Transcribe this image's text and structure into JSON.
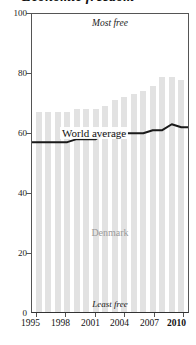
{
  "title": "Economic freedom",
  "chart_data": {
    "type": "bar",
    "title": "Economic freedom",
    "xlabel": "",
    "ylabel": "",
    "ylim": [
      0,
      100
    ],
    "grid": false,
    "legend": "inline-labels",
    "x": [
      1995,
      1996,
      1997,
      1998,
      1999,
      2000,
      2001,
      2002,
      2003,
      2004,
      2005,
      2006,
      2007,
      2008,
      2009,
      2010
    ],
    "categories": [
      "1995",
      "1996",
      "1997",
      "1998",
      "1999",
      "2000",
      "2001",
      "2002",
      "2003",
      "2004",
      "2005",
      "2006",
      "2007",
      "2008",
      "2009",
      "2010"
    ],
    "series": [
      {
        "name": "Denmark",
        "type": "bar",
        "values": [
          67,
          67,
          67,
          67,
          68,
          68,
          68,
          69,
          71,
          72,
          73,
          74,
          76,
          79,
          79,
          78
        ]
      },
      {
        "name": "World average",
        "type": "line",
        "values": [
          57,
          57,
          57,
          57,
          58,
          58,
          58,
          60,
          60,
          60,
          60,
          60,
          61,
          61,
          63,
          62
        ]
      }
    ],
    "y_ticks": [
      0,
      20,
      40,
      60,
      80,
      100
    ],
    "y_tick_labels": [
      "0",
      "20",
      "40",
      "60",
      "80",
      "100"
    ],
    "x_ticks": [
      1995,
      1998,
      2001,
      2004,
      2007,
      2010
    ],
    "x_tick_labels": [
      "1995",
      "1998",
      "2001",
      "2004",
      "2007",
      "2010"
    ],
    "x_tick_bold": [
      "2010"
    ],
    "annotations": [
      {
        "name": "most-free",
        "text": "Most free",
        "position": "top-center"
      },
      {
        "name": "least-free",
        "text": "Least free",
        "position": "bottom-center"
      },
      {
        "name": "world-average-label",
        "text": "World average",
        "position": "inline-line"
      },
      {
        "name": "denmark-label",
        "text": "Denmark",
        "position": "inside-bars"
      }
    ],
    "colors": {
      "bar": "#e2e2e2",
      "line": "#1a1a1a",
      "axis": "#555555",
      "text": "#1a1a1a",
      "country_label": "#9a9a9a",
      "background": "#ffffff"
    }
  },
  "axis": {
    "y_labels": [
      "100",
      "80",
      "60",
      "40",
      "20",
      "0"
    ],
    "x_labels": [
      "1995",
      "1998",
      "2001",
      "2004",
      "2007",
      "2010"
    ]
  },
  "annotations": {
    "most_free": "Most free",
    "least_free": "Least free",
    "world_average": "World average",
    "denmark": "Denmark"
  }
}
